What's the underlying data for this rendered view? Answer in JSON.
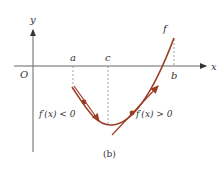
{
  "figure": {
    "caption": "(b)",
    "axis_labels": {
      "x": "x",
      "y": "y",
      "origin": "O"
    },
    "point_labels": {
      "a": "a",
      "c": "c",
      "b": "b"
    },
    "function_label": "f",
    "annotations": {
      "left": "f′(x) < 0",
      "right": "f′(x) > 0"
    },
    "colors": {
      "curve": "#9a3b22",
      "axis": "#555555",
      "dashed": "#888888"
    }
  }
}
